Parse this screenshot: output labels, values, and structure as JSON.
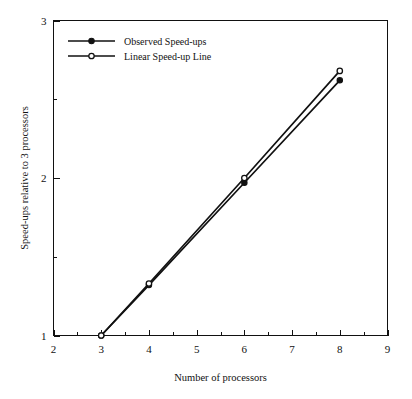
{
  "chart_data": {
    "type": "line",
    "title": "",
    "xlabel": "Number of processors",
    "ylabel": "Speed-ups relative to 3 processors",
    "xlim": [
      2,
      9
    ],
    "ylim": [
      1,
      3
    ],
    "xticks": [
      2,
      3,
      4,
      5,
      6,
      7,
      8,
      9
    ],
    "xticklabels": [
      "2",
      "3",
      "4",
      "5",
      "6",
      "7",
      "8",
      "9"
    ],
    "xminorticks": [
      2.5,
      3.5,
      4.5,
      5.5,
      6.5,
      7.5,
      8.5
    ],
    "yticks": [
      1,
      2,
      3
    ],
    "yticklabels": [
      "1",
      "2",
      "3"
    ],
    "yminorticks": [
      1.5,
      2.5
    ],
    "grid": false,
    "legend_position": "upper left",
    "series": [
      {
        "name": "Observed Speed-ups",
        "marker": "filled-circle",
        "x": [
          3,
          4,
          6,
          8
        ],
        "values": [
          1.0,
          1.32,
          1.97,
          2.62
        ]
      },
      {
        "name": "Linear Speed-up Line",
        "marker": "open-circle",
        "x": [
          3,
          4,
          6,
          8
        ],
        "values": [
          1.0,
          1.33,
          2.0,
          2.68
        ]
      }
    ]
  },
  "legend": {
    "entries": [
      {
        "label": "Observed Speed-ups"
      },
      {
        "label": "Linear Speed-up Line"
      }
    ]
  },
  "axes": {
    "x_title": "Number of processors",
    "y_title": "Speed-ups relative to 3 processors"
  },
  "colors": {
    "ink": "#111111",
    "background": "#ffffff"
  }
}
